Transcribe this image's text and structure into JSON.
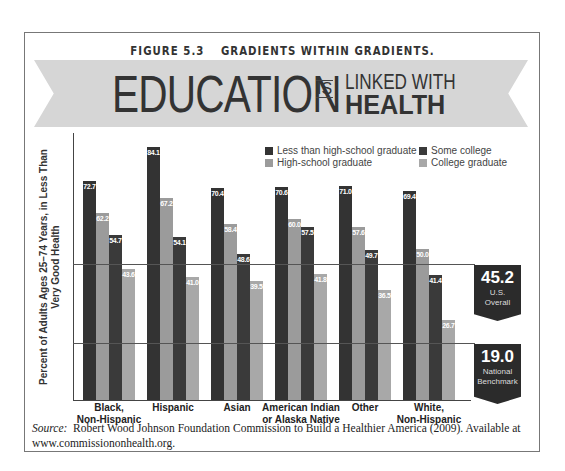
{
  "figure": {
    "number": "FIGURE 5.3",
    "title": "GRADIENTS WITHIN GRADIENTS."
  },
  "headline": {
    "word1": "EDUCATION",
    "word2": "IS",
    "word3": "LINKED WITH",
    "word4": "HEALTH"
  },
  "badges": [
    {
      "value": "45.2",
      "line1": "U.S.",
      "line2": "Overall"
    },
    {
      "value": "19.0",
      "line1": "National",
      "line2": "Benchmark"
    }
  ],
  "source": {
    "label": "Source:",
    "text": "Robert Wood Johnson Foundation Commission to Build a Healthier America (2009). Available at www.commissiononhealth.org."
  },
  "chart_data": {
    "type": "bar",
    "title": "EDUCATION IS LINKED WITH HEALTH",
    "xlabel": "",
    "ylabel": "Percent of Adults Ages 25–74 Years, in Less Than Very Good Health",
    "ylim": [
      0,
      88
    ],
    "grid": false,
    "legend_position": "top-right",
    "categories": [
      "Black, Non-Hispanic",
      "Hispanic",
      "Asian",
      "American Indian or Alaska Native",
      "Other",
      "White, Non-Hispanic"
    ],
    "category_lines": [
      [
        "Black,",
        "Non-Hispanic"
      ],
      [
        "Hispanic",
        ""
      ],
      [
        "Asian",
        ""
      ],
      [
        "American Indian",
        "or Alaska Native"
      ],
      [
        "Other",
        ""
      ],
      [
        "White,",
        "Non-Hispanic"
      ]
    ],
    "series": [
      {
        "name": "Less than high-school graduate",
        "color": "#333333",
        "values": [
          72.7,
          84.1,
          70.4,
          70.6,
          71.0,
          69.4
        ]
      },
      {
        "name": "High-school graduate",
        "color": "#9b9b9b",
        "values": [
          62.2,
          67.2,
          58.4,
          60.0,
          57.6,
          50.0
        ]
      },
      {
        "name": "Some college",
        "color": "#3a3a3a",
        "values": [
          54.7,
          54.1,
          48.6,
          57.5,
          49.7,
          41.4
        ]
      },
      {
        "name": "College graduate",
        "color": "#a8a8a8",
        "values": [
          43.6,
          41.0,
          39.5,
          41.8,
          36.5,
          26.7
        ]
      }
    ],
    "reference_lines": [
      {
        "value": 45.2,
        "label": "U.S. Overall"
      },
      {
        "value": 19.0,
        "label": "National Benchmark"
      }
    ]
  }
}
